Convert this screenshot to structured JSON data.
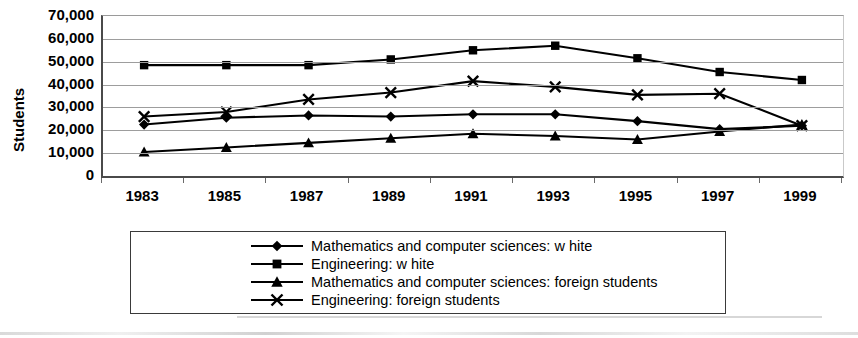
{
  "chart_data": {
    "type": "line",
    "title": "",
    "xlabel": "",
    "ylabel": "Students",
    "categories": [
      "1983",
      "1985",
      "1987",
      "1989",
      "1991",
      "1993",
      "1995",
      "1997",
      "1999"
    ],
    "ylim": [
      0,
      70000
    ],
    "ytick_values": [
      0,
      10000,
      20000,
      30000,
      40000,
      50000,
      60000,
      70000
    ],
    "ytick_labels": [
      "0",
      "10,000",
      "20,000",
      "30,000",
      "40,000",
      "50,000",
      "60,000",
      "70,000"
    ],
    "grid": true,
    "legend_position": "bottom",
    "series": [
      {
        "name": "Mathematics and computer sciences: w hite",
        "marker": "diamond",
        "values": [
          22500,
          25500,
          26500,
          26000,
          27000,
          27000,
          24000,
          20500,
          22000
        ]
      },
      {
        "name": "Engineering: w hite",
        "marker": "square",
        "values": [
          48500,
          48500,
          48500,
          51000,
          55000,
          57000,
          51500,
          45500,
          42000
        ]
      },
      {
        "name": "Mathematics and computer sciences: foreign students",
        "marker": "triangle",
        "values": [
          10500,
          12500,
          14500,
          16500,
          18500,
          17500,
          16000,
          19500,
          22500
        ]
      },
      {
        "name": "Engineering: foreign students",
        "marker": "x",
        "values": [
          26000,
          28000,
          33500,
          36500,
          41500,
          39000,
          35500,
          36000,
          22000
        ]
      }
    ]
  },
  "colors": {
    "series": "#000000",
    "grid": "#9d9d9d",
    "axis": "#4a4a4a",
    "background": "#ffffff",
    "legend_border": "#3a3a3a"
  }
}
